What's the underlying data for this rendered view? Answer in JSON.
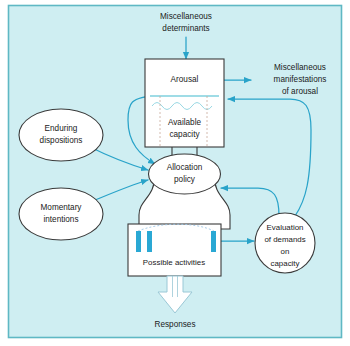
{
  "figure": {
    "background_color": "#cfeef2",
    "frame_color": "#5fb8c4",
    "line_color": "#29a3c9",
    "node_stroke_color": "#3a3a3a",
    "node_fill_color": "#ffffff",
    "bar_color": "#2aa8d4",
    "text_color": "#1a1a1a"
  },
  "nodes": {
    "miscellaneous_determinants": {
      "shape": "text",
      "lines": [
        "Miscellaneous",
        "determinants"
      ]
    },
    "arousal_box": {
      "shape": "rect",
      "title": "Arousal",
      "capacity_label_lines": [
        "Available",
        "capacity"
      ]
    },
    "miscellaneous_manifestations": {
      "shape": "text",
      "lines": [
        "Miscellaneous",
        "manifestations",
        "of arousal"
      ]
    },
    "enduring_dispositions": {
      "shape": "ellipse",
      "lines": [
        "Enduring",
        "dispositions"
      ]
    },
    "momentary_intentions": {
      "shape": "ellipse",
      "lines": [
        "Momentary",
        "intentions"
      ]
    },
    "allocation_policy": {
      "shape": "ellipse-funnel",
      "lines": [
        "Allocation",
        "policy"
      ]
    },
    "possible_activities": {
      "shape": "rect",
      "label": "Possible activities",
      "bars": [
        {
          "x": 136,
          "y": 231,
          "width": 5,
          "height": 21
        },
        {
          "x": 147,
          "y": 231,
          "width": 5,
          "height": 21
        },
        {
          "x": 211,
          "y": 231,
          "width": 5,
          "height": 21
        }
      ]
    },
    "evaluation_of_demands": {
      "shape": "circle",
      "lines": [
        "Evaluation",
        "of demands",
        "on",
        "capacity"
      ]
    },
    "responses": {
      "shape": "block-arrow-label",
      "label": "Responses"
    }
  },
  "edges": [
    {
      "from": "miscellaneous_determinants",
      "to": "arousal_box",
      "style": "straight-arrow"
    },
    {
      "from": "arousal_box",
      "to": "miscellaneous_manifestations",
      "style": "straight-arrow"
    },
    {
      "from": "arousal_box_capacity",
      "to": "allocation_policy",
      "style": "curved-arrow"
    },
    {
      "from": "enduring_dispositions",
      "to": "allocation_policy",
      "style": "curved-arrow"
    },
    {
      "from": "momentary_intentions",
      "to": "allocation_policy",
      "style": "curved-arrow"
    },
    {
      "from": "allocation_policy",
      "to": "possible_activities",
      "style": "funnel"
    },
    {
      "from": "possible_activities",
      "to": "evaluation_of_demands",
      "style": "straight-arrow"
    },
    {
      "from": "evaluation_of_demands",
      "to": "allocation_policy",
      "style": "curved-arrow"
    },
    {
      "from": "evaluation_of_demands",
      "to": "arousal_box_capacity",
      "style": "curved-arrow"
    },
    {
      "from": "possible_activities",
      "to": "responses",
      "style": "hollow-block-arrow"
    }
  ]
}
